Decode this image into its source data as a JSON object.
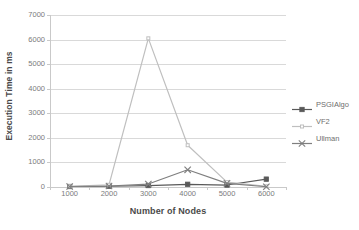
{
  "chart_data": {
    "type": "line",
    "title": "",
    "xlabel": "Number of Nodes",
    "ylabel": "Execution Time in ms",
    "categories": [
      "1000",
      "2000",
      "3000",
      "4000",
      "5000",
      "6000"
    ],
    "series": [
      {
        "name": "PSGIAlgo",
        "color": "#595959",
        "marker": "square",
        "values": [
          20,
          30,
          60,
          110,
          80,
          320
        ]
      },
      {
        "name": "VF2",
        "color": "#bfbfbf",
        "marker": "small-square",
        "values": [
          30,
          90,
          6050,
          1700,
          200,
          30
        ]
      },
      {
        "name": "Ullman",
        "color": "#7f7f7f",
        "marker": "x",
        "values": [
          20,
          40,
          120,
          700,
          150,
          10
        ]
      }
    ],
    "ylim": [
      0,
      7000
    ],
    "y_ticks": [
      0,
      1000,
      2000,
      3000,
      4000,
      5000,
      6000,
      7000
    ],
    "y_tick_labels": [
      "0",
      "1000",
      "2000",
      "3000",
      "4000",
      "5000",
      "6000",
      "7000"
    ],
    "grid": true,
    "legend_position": "right",
    "background_color": "#ffffff",
    "gridline_color": "#d9d9d9",
    "axis_color": "#c9c9c9"
  },
  "legend": {
    "items": [
      {
        "label": "PSGIAlgo"
      },
      {
        "label": "VF2"
      },
      {
        "label": "Ullman"
      }
    ]
  }
}
